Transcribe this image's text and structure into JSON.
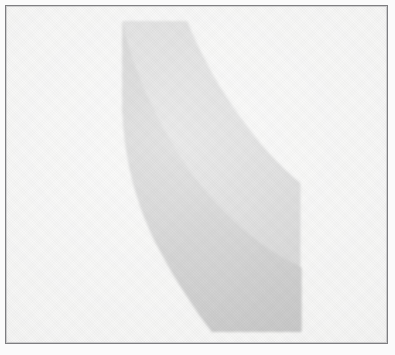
{
  "document": {
    "kind": "scanned-figure",
    "title": "Scanned grayscale figure",
    "description": "Hook-shaped curved band rendered in two gray tones inside a thin ruled rectangular frame on off-white scanned paper.",
    "caption": ""
  },
  "canvas": {
    "width": 395,
    "height": 355,
    "paper_color": "#fbfbfb",
    "plate_color": "#f4f4f3"
  },
  "frame": {
    "name": "figure-border",
    "x": 5,
    "y": 5,
    "width": 383,
    "height": 339,
    "stroke_color": "#7d7d80",
    "stroke_width": 1
  },
  "figure": {
    "name": "curved-band",
    "shape": "hook",
    "regions": [
      {
        "id": "outer-light-band",
        "label": "Light gray outer band",
        "fill": "#d4d4d4",
        "tone_value": 212,
        "path": "M 122 20 L 187 20 C 215 72 252 132 300 183 L 300 268 C 238 232 186 182 154 126 C 135 92 125 56 122 20 Z"
      },
      {
        "id": "inner-dark-band",
        "label": "Medium gray inner band",
        "fill": "#c5c5c5",
        "tone_value": 197,
        "path": "M 122 112 C 128 152 142 194 166 232 C 198 281 244 315 302 333 L 302 268 C 238 232 186 182 154 126 C 140 104 130 82 122 60 Z"
      }
    ],
    "geometry": {
      "left_edge_x": 122,
      "top_edge_y": 20,
      "top_edge_right_x": 187,
      "right_vertex": [
        300,
        183
      ],
      "right_edge_x": 302,
      "inner_right_crossing_y": 268,
      "bottom_edge_y": 333,
      "bottom_edge_left_x": 208,
      "inner_left_crossing_y": 112
    }
  },
  "colors": {
    "background": "#f4f4f3",
    "paper": "#fbfbfb",
    "border": "#7d7d80",
    "light_gray": "#d4d4d4",
    "dark_gray": "#c5c5c5"
  }
}
